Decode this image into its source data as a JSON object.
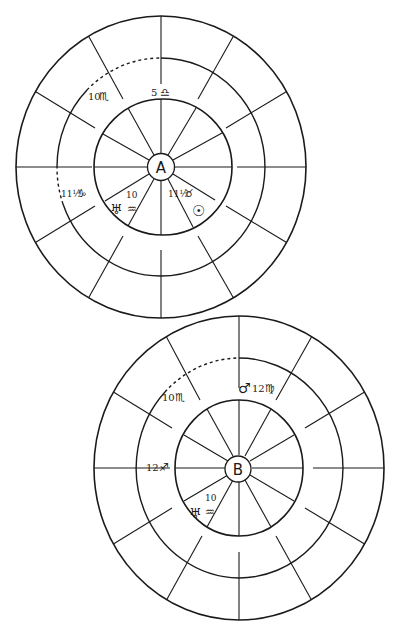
{
  "figure": {
    "stroke_color": "#1a1a1a",
    "background": "#ffffff"
  },
  "charts": [
    {
      "id": "A",
      "center_label": "A",
      "geometry": {
        "cx": 161,
        "cy": 167,
        "outer_rx": 145,
        "outer_ry": 151,
        "middle_rx": 104,
        "middle_ry": 109,
        "inner_rx": 69,
        "inner_ry": 68,
        "hub_r": 13.5
      },
      "labels": [
        {
          "name": "cusp-5-libra",
          "number": "5",
          "sign": "♎",
          "sign_name": "Libra"
        },
        {
          "name": "cusp-10-scorpio",
          "number": "10",
          "sign": "♏",
          "sign_name": "Scorpio"
        },
        {
          "name": "cusp-11half-capricorn",
          "number": "11½",
          "sign": "♑",
          "sign_name": "Capricorn"
        },
        {
          "name": "uranus-10-aquarius",
          "planet": "♅",
          "planet_name": "Uranus",
          "number": "10",
          "sign": "♒",
          "sign_name": "Aquarius"
        },
        {
          "name": "cusp-11half-taurus",
          "number": "11½",
          "sign": "♉",
          "sign_name": "Taurus"
        },
        {
          "name": "sun",
          "planet": "☉",
          "planet_name": "Sun"
        }
      ]
    },
    {
      "id": "B",
      "center_label": "B",
      "geometry": {
        "cx": 238,
        "cy": 469,
        "outer_rx": 145,
        "outer_ry": 152,
        "middle_rx": 104,
        "middle_ry": 110,
        "inner_rx": 64,
        "inner_ry": 68,
        "hub_r": 13
      },
      "labels": [
        {
          "name": "cusp-10-scorpio",
          "number": "10",
          "sign": "♏",
          "sign_name": "Scorpio"
        },
        {
          "name": "mars-12-virgo",
          "planet": "♂",
          "planet_name": "Mars",
          "number": "12",
          "sign": "♍",
          "sign_name": "Virgo"
        },
        {
          "name": "cusp-12-sagittarius",
          "number": "12",
          "sign": "♐",
          "sign_name": "Sagittarius"
        },
        {
          "name": "uranus-10-aquarius",
          "planet": "♅",
          "planet_name": "Uranus",
          "number": "10",
          "sign": "♒",
          "sign_name": "Aquarius"
        }
      ]
    }
  ]
}
